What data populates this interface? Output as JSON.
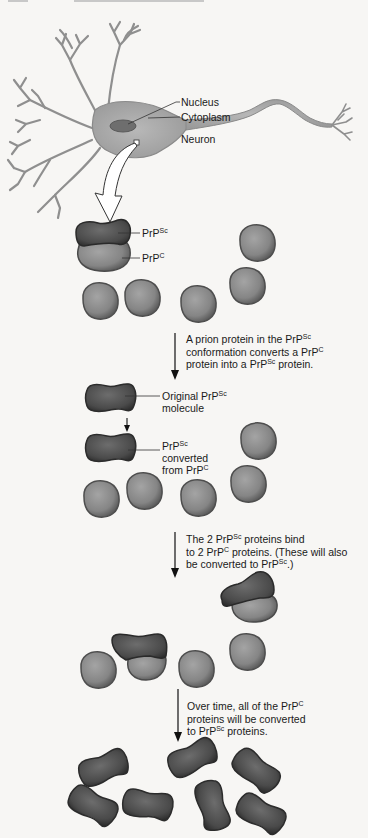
{
  "figure": {
    "type": "prion-conversion-diagram",
    "neuron": {
      "labels": {
        "nucleus": "Nucleus",
        "cytoplasm": "Cytoplasm",
        "neuron": "Neuron"
      }
    },
    "step1": {
      "labels": {
        "prpsc_base": "PrP",
        "prpsc_sup": "Sc",
        "prpc_base": "PrP",
        "prpc_sup": "C"
      }
    },
    "caption1": {
      "line1_a": "A prion protein in the PrP",
      "line1_sup": "Sc",
      "line2_a": "conformation converts a PrP",
      "line2_sup": "C",
      "line3_a": "protein into a PrP",
      "line3_sup": "Sc",
      "line3_b": " protein."
    },
    "step2": {
      "original_label_a": "Original PrP",
      "original_label_sup": "Sc",
      "original_label_b": "molecule",
      "converted_label_a": "PrP",
      "converted_label_sup": "Sc",
      "converted_label_b": "converted",
      "converted_label_c": "from PrP",
      "converted_label_c_sup": "C"
    },
    "caption2": {
      "line1_a": "The 2 PrP",
      "line1_sup": "Sc",
      "line1_b": " proteins bind",
      "line2_a": "to 2 PrP",
      "line2_sup": "C",
      "line2_b": " proteins. (These will also",
      "line3_a": "be converted to PrP",
      "line3_sup": "Sc",
      "line3_b": ".)"
    },
    "caption3": {
      "line1_a": "Over time, all of the PrP",
      "line1_sup": "C",
      "line2_a": "proteins will be converted",
      "line3_a": "to PrP",
      "line3_sup": "Sc",
      "line3_b": " proteins."
    },
    "colors": {
      "background": "#f7f6f4",
      "prpc_fill": "#8a8a8a",
      "prpsc_fill": "#4a4a4a",
      "neuron_fill": "#a9a9a9",
      "text": "#1a1a1a"
    }
  }
}
